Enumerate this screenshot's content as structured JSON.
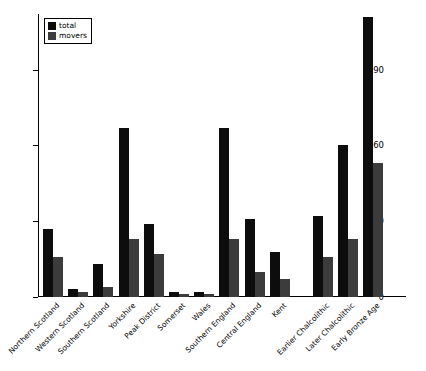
{
  "chart_data": {
    "type": "bar",
    "title": "",
    "xlabel": "",
    "ylabel": "",
    "ylim": [
      0,
      112
    ],
    "yticks": [
      0,
      30,
      60,
      90
    ],
    "grid": false,
    "legend_position": "top-left",
    "categories": [
      "Northern Scotland",
      "Western Scotland",
      "Southern Scotland",
      "Yorkshire",
      "Peak District",
      "Somerset",
      "Wales",
      "Southern England",
      "Central England",
      "Kent",
      "Earlier Chalcolithic",
      "Later Chalcolithic",
      "Early Bronze Age"
    ],
    "series": [
      {
        "name": "total",
        "color": "#0d0d0d",
        "values": [
          27,
          3,
          13,
          67,
          29,
          2,
          2,
          67,
          31,
          18,
          32,
          60,
          111
        ]
      },
      {
        "name": "movers",
        "color": "#3c3c3c",
        "values": [
          16,
          2,
          4,
          23,
          17,
          1,
          1,
          23,
          10,
          7,
          16,
          23,
          53
        ]
      }
    ],
    "group_gap_after_index": 9
  }
}
